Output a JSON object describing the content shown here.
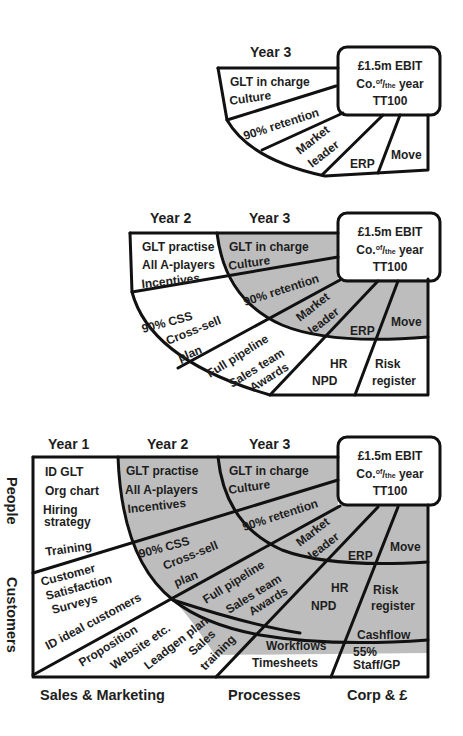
{
  "colors": {
    "shade": "#bdbdbd",
    "line": "#111111",
    "text": "#1e1e1e",
    "background": "#ffffff"
  },
  "panel1": {
    "headers": [
      "Year 3"
    ],
    "goal": {
      "line1": "£1.5m EBIT",
      "line2_a": "Co.",
      "line2_sup": "of",
      "line2_slash": "/",
      "line2_sub": "the",
      "line2_b": " year",
      "line3": "TT100"
    },
    "cells": [
      "GLT in charge",
      "Culture",
      "90% retention",
      "Market",
      "leader",
      "ERP",
      "Move"
    ]
  },
  "panel2": {
    "headers": [
      "Year 2",
      "Year 3"
    ],
    "goal": {
      "line1": "£1.5m EBIT",
      "line2_a": "Co.",
      "line2_sup": "of",
      "line2_slash": "/",
      "line2_sub": "the",
      "line2_b": " year",
      "line3": "TT100"
    },
    "cells": [
      "GLT practise",
      "All A-players",
      "Incentives",
      "90% CSS",
      "Cross-sell",
      "plan",
      "Full pipeline",
      "Sales team",
      "Awards",
      "HR",
      "NPD",
      "Risk",
      "register",
      "GLT in charge",
      "Culture",
      "90% retention",
      "Market",
      "leader",
      "ERP",
      "Move"
    ]
  },
  "panel3": {
    "headers": [
      "Year 1",
      "Year 2",
      "Year 3"
    ],
    "row_labels": [
      "People",
      "Customers"
    ],
    "column_labels": [
      "Sales & Marketing",
      "Processes",
      "Corp & £"
    ],
    "goal": {
      "line1": "£1.5m EBIT",
      "line2_a": "Co.",
      "line2_sup": "of",
      "line2_slash": "/",
      "line2_sub": "the",
      "line2_b": " year",
      "line3": "TT100"
    },
    "cells": [
      "ID GLT",
      "Org chart",
      "Hiring",
      "strategy",
      "Training",
      "Customer",
      "Satisfaction",
      "Surveys",
      "ID ideal customers",
      "Proposition",
      "Website etc.",
      "Leadgen plan",
      "Sales",
      "training",
      "Workflows",
      "Timesheets",
      "Cashflow",
      "55%",
      "Staff/GP",
      "GLT practise",
      "All A-players",
      "Incentives",
      "90% CSS",
      "Cross-sell",
      "plan",
      "Full pipeline",
      "Sales team",
      "Awards",
      "HR",
      "NPD",
      "Risk",
      "register",
      "GLT in charge",
      "Culture",
      "90% retention",
      "Market",
      "leader",
      "ERP",
      "Move"
    ]
  }
}
